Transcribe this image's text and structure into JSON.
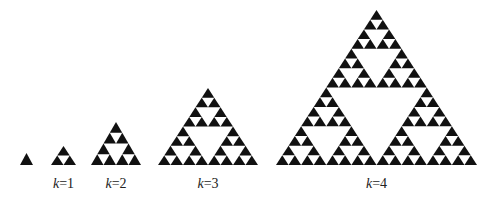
{
  "figure": {
    "type": "sierpinski-triangle-iterations",
    "fill_color": "#111111",
    "background": "#ffffff",
    "baseline_y": 165,
    "triangles": [
      {
        "k": 0,
        "label": "",
        "x_left": 20,
        "x_right": 33,
        "apex_y": 153
      },
      {
        "k": 1,
        "label": "k=1",
        "var": "k",
        "eq": "=",
        "value": "1",
        "x_left": 51,
        "x_right": 76,
        "apex_y": 146
      },
      {
        "k": 2,
        "label": "k=2",
        "var": "k",
        "eq": "=",
        "value": "2",
        "x_left": 91,
        "x_right": 141,
        "apex_y": 122
      },
      {
        "k": 3,
        "label": "k=3",
        "var": "k",
        "eq": "=",
        "value": "3",
        "x_left": 158,
        "x_right": 258,
        "apex_y": 88
      },
      {
        "k": 4,
        "label": "k=4",
        "var": "k",
        "eq": "=",
        "value": "4",
        "x_left": 276,
        "x_right": 477,
        "apex_y": 10
      }
    ],
    "label_y": 176
  }
}
